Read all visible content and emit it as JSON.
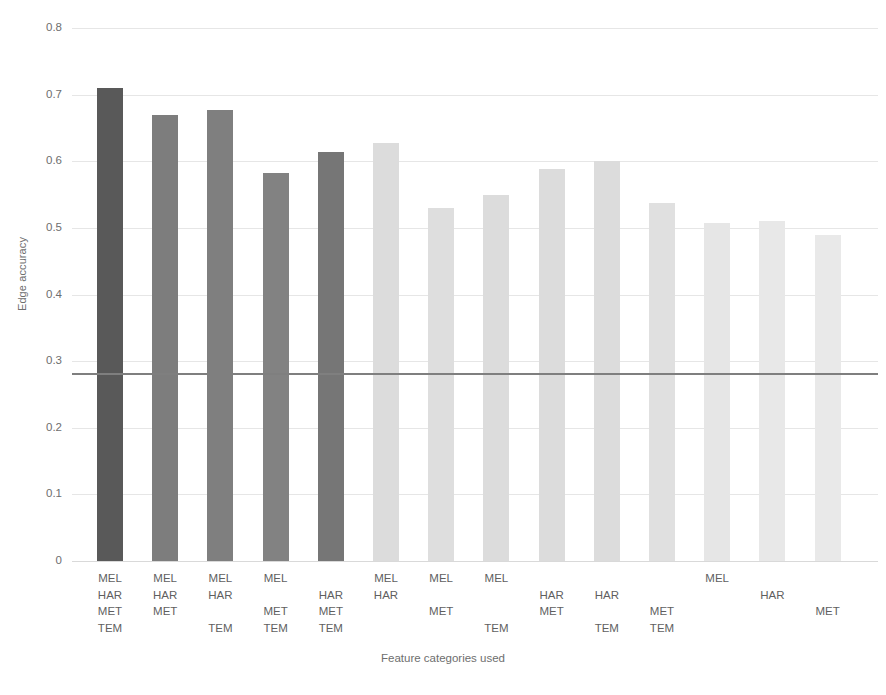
{
  "chart_data": {
    "type": "bar",
    "title": "",
    "xlabel": "Feature categories used",
    "ylabel": "Edge accuracy",
    "ylim": [
      0,
      0.8
    ],
    "ytick_labels": [
      "0.8",
      "0.7",
      "0.6",
      "0.5",
      "0.4",
      "0.3",
      "0.2",
      "0.1",
      "0"
    ],
    "ytick_values": [
      0.8,
      0.7,
      0.6,
      0.5,
      0.4,
      0.3,
      0.2,
      0.1,
      0
    ],
    "grid": true,
    "legend": "none",
    "feature_rows": [
      "MEL",
      "HAR",
      "MET",
      "TEM"
    ],
    "baseline_line": {
      "value": 0.281,
      "color": "#7f7f7f",
      "label": ""
    },
    "categories": [
      "MEL HAR MET TEM",
      "MEL HAR MET",
      "MEL HAR TEM",
      "MEL MET TEM",
      "HAR MET TEM",
      "MEL HAR",
      "MEL MET",
      "MEL TEM",
      "HAR MET",
      "HAR TEM",
      "MET TEM",
      "MEL",
      "HAR",
      "MET"
    ],
    "values": [
      0.71,
      0.67,
      0.677,
      0.582,
      0.614,
      0.627,
      0.53,
      0.55,
      0.589,
      0.6,
      0.537,
      0.508,
      0.51,
      0.49
    ],
    "bar_colors": [
      "#595959",
      "#7d7d7d",
      "#7f7f7f",
      "#828282",
      "#767676",
      "#dcdcdc",
      "#dedede",
      "#dcdcdc",
      "#dcdcdc",
      "#dcdcdc",
      "#e0e0e0",
      "#e6e6e6",
      "#e8e8e8",
      "#e9e9e9"
    ],
    "bars": [
      {
        "value": 0.71,
        "color": "#595959",
        "labels": [
          "MEL",
          "HAR",
          "MET",
          "TEM"
        ]
      },
      {
        "value": 0.67,
        "color": "#7d7d7d",
        "labels": [
          "MEL",
          "HAR",
          "MET",
          ""
        ]
      },
      {
        "value": 0.677,
        "color": "#7f7f7f",
        "labels": [
          "MEL",
          "HAR",
          "",
          "TEM"
        ]
      },
      {
        "value": 0.582,
        "color": "#828282",
        "labels": [
          "MEL",
          "",
          "MET",
          "TEM"
        ]
      },
      {
        "value": 0.614,
        "color": "#767676",
        "labels": [
          "",
          "HAR",
          "MET",
          "TEM"
        ]
      },
      {
        "value": 0.627,
        "color": "#dcdcdc",
        "labels": [
          "MEL",
          "HAR",
          "",
          ""
        ]
      },
      {
        "value": 0.53,
        "color": "#dedede",
        "labels": [
          "MEL",
          "",
          "MET",
          ""
        ]
      },
      {
        "value": 0.55,
        "color": "#dcdcdc",
        "labels": [
          "MEL",
          "",
          "",
          "TEM"
        ]
      },
      {
        "value": 0.589,
        "color": "#dcdcdc",
        "labels": [
          "",
          "HAR",
          "MET",
          ""
        ]
      },
      {
        "value": 0.6,
        "color": "#dcdcdc",
        "labels": [
          "",
          "HAR",
          "",
          "TEM"
        ]
      },
      {
        "value": 0.537,
        "color": "#e0e0e0",
        "labels": [
          "",
          "",
          "MET",
          "TEM"
        ]
      },
      {
        "value": 0.508,
        "color": "#e6e6e6",
        "labels": [
          "MEL",
          "",
          "",
          ""
        ]
      },
      {
        "value": 0.51,
        "color": "#e8e8e8",
        "labels": [
          "",
          "HAR",
          "",
          ""
        ]
      },
      {
        "value": 0.49,
        "color": "#e9e9e9",
        "labels": [
          "",
          "",
          "MET",
          ""
        ]
      }
    ]
  },
  "layout": {
    "plot_left": 72,
    "plot_top": 28,
    "plot_width": 806,
    "plot_height": 533,
    "bar_width": 26,
    "bar_pitch": 55.2,
    "bar_first_center": 110
  }
}
